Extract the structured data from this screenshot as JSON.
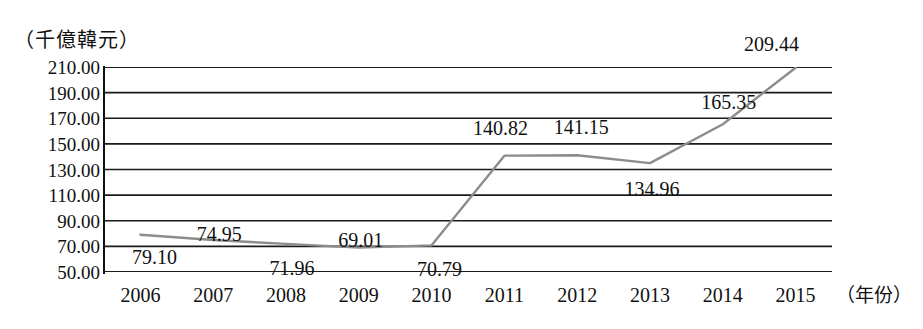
{
  "chart_data": {
    "type": "line",
    "title": "",
    "subtitle": "",
    "xlabel": "（年份）",
    "ylabel": "（千億韓元）",
    "categories": [
      "2006",
      "2007",
      "2008",
      "2009",
      "2010",
      "2011",
      "2012",
      "2013",
      "2014",
      "2015"
    ],
    "values": [
      79.1,
      74.95,
      71.96,
      69.01,
      70.79,
      140.82,
      141.15,
      134.96,
      165.35,
      209.44
    ],
    "point_labels": [
      "79.10",
      "74.95",
      "71.96",
      "69.01",
      "70.79",
      "140.82",
      "141.15",
      "134.96",
      "165.35",
      "209.44"
    ],
    "ylim": [
      50,
      210
    ],
    "ytick_step": 20,
    "ytick_labels": [
      "210.00",
      "190.00",
      "170.00",
      "150.00",
      "130.00",
      "110.00",
      "90.00",
      "70.00",
      "50.00"
    ],
    "ytick_values": [
      210,
      190,
      170,
      150,
      130,
      110,
      90,
      70,
      50
    ],
    "grid": true,
    "grid_axis": "y",
    "legend": false,
    "legend_position": "none",
    "series": [
      {
        "name": "",
        "color": "#8c8c8c",
        "values": [
          79.1,
          74.95,
          71.96,
          69.01,
          70.79,
          140.82,
          141.15,
          134.96,
          165.35,
          209.44
        ]
      }
    ],
    "colors": {
      "line": "#8c8c8c",
      "grid": "#1a1a1a",
      "axis": "#111111",
      "text": "#111111",
      "background": "#ffffff"
    },
    "label_offsets": [
      {
        "label": "79.10",
        "dx": 14,
        "dy": 22
      },
      {
        "label": "74.95",
        "dx": 6,
        "dy": -6
      },
      {
        "label": "71.96",
        "dx": 6,
        "dy": 24
      },
      {
        "label": "69.01",
        "dx": 2,
        "dy": -8
      },
      {
        "label": "70.79",
        "dx": 8,
        "dy": 24
      },
      {
        "label": "140.82",
        "dx": -4,
        "dy": -28
      },
      {
        "label": "141.15",
        "dx": 4,
        "dy": -28
      },
      {
        "label": "134.96",
        "dx": 2,
        "dy": 26
      },
      {
        "label": "165.35",
        "dx": 6,
        "dy": -22
      },
      {
        "label": "209.44",
        "dx": -24,
        "dy": -24
      }
    ]
  }
}
